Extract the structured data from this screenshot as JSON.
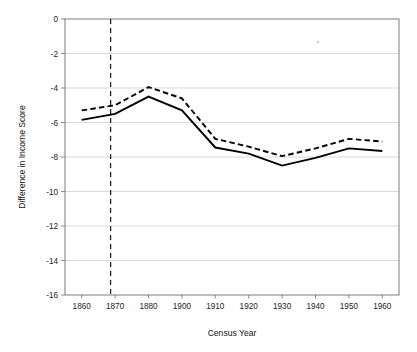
{
  "chart_data": {
    "type": "line",
    "title": "",
    "xlabel": "Census Year",
    "ylabel": "Difference in Income Score",
    "categories": [
      "1860",
      "1870",
      "1880",
      "1900",
      "1910",
      "1920",
      "1930",
      "1940",
      "1950",
      "1960"
    ],
    "ylim": [
      -16,
      0
    ],
    "y_ticks": [
      "0",
      "-2",
      "-4",
      "-6",
      "-8",
      "-10",
      "-12",
      "-14",
      "-16"
    ],
    "y_tick_values": [
      0,
      -2,
      -4,
      -6,
      -8,
      -10,
      -12,
      -14,
      -16
    ],
    "grid": "horizontal",
    "legend": "none",
    "series": [
      {
        "name": "solid-line",
        "style": "solid",
        "values": [
          -5.85,
          -5.5,
          -4.5,
          -5.3,
          -7.45,
          -7.8,
          -8.5,
          -8.05,
          -7.5,
          -7.65
        ]
      },
      {
        "name": "dashed-line",
        "style": "dashed",
        "values": [
          -5.3,
          -5.0,
          -3.95,
          -4.6,
          -6.95,
          -7.4,
          -7.95,
          -7.5,
          -6.95,
          -7.1
        ]
      }
    ],
    "annotations": [
      {
        "name": "vertical-reference-line",
        "style": "dashed-vertical",
        "x_value": 1869,
        "label": ""
      }
    ]
  },
  "axes": {
    "x_title": "Census Year",
    "y_title": "Difference in Income Score"
  }
}
